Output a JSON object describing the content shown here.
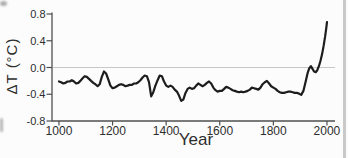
{
  "figure": {
    "background": "#fcfcfc",
    "line_color": "#1d1d1d",
    "axis_color": "#4f4f4f",
    "zero_line_color": "#c8c8c8",
    "text_color": "#2e2e2e",
    "artifact_color": "#c9c9c9"
  },
  "chart_data": {
    "type": "line",
    "title": "",
    "xlabel": "Year",
    "ylabel": "ΔT (°C)",
    "xlim": [
      974,
      2030
    ],
    "ylim": [
      -0.8,
      0.8
    ],
    "grid": "horizontal zero line only",
    "legend": "none",
    "x_ticks": {
      "values": [
        1000,
        1200,
        1400,
        1600,
        1800,
        2000
      ],
      "labels": [
        "1000",
        "1200",
        "1400",
        "1600",
        "1800",
        "2000"
      ]
    },
    "y_ticks": {
      "values": [
        0.8,
        0.4,
        0.0,
        -0.4,
        -0.8
      ],
      "labels": [
        "0.8",
        "0.4",
        "0.0",
        "-0.4",
        "-0.8"
      ]
    },
    "series": [
      {
        "name": "Temperature anomaly reconstruction",
        "x": [
          1000,
          1008,
          1016,
          1024,
          1032,
          1040,
          1048,
          1056,
          1064,
          1072,
          1080,
          1088,
          1096,
          1104,
          1112,
          1120,
          1128,
          1136,
          1144,
          1152,
          1160,
          1168,
          1176,
          1184,
          1192,
          1200,
          1208,
          1216,
          1224,
          1232,
          1240,
          1248,
          1256,
          1264,
          1272,
          1280,
          1288,
          1296,
          1304,
          1312,
          1320,
          1328,
          1336,
          1344,
          1352,
          1360,
          1368,
          1376,
          1384,
          1392,
          1400,
          1408,
          1416,
          1424,
          1432,
          1440,
          1448,
          1456,
          1464,
          1472,
          1480,
          1488,
          1496,
          1504,
          1512,
          1520,
          1528,
          1536,
          1544,
          1552,
          1560,
          1568,
          1576,
          1584,
          1592,
          1600,
          1608,
          1616,
          1624,
          1632,
          1640,
          1648,
          1656,
          1664,
          1672,
          1680,
          1688,
          1696,
          1704,
          1712,
          1720,
          1728,
          1736,
          1744,
          1752,
          1760,
          1768,
          1776,
          1784,
          1792,
          1800,
          1808,
          1816,
          1824,
          1832,
          1840,
          1848,
          1856,
          1864,
          1872,
          1880,
          1888,
          1896,
          1904,
          1912,
          1920,
          1928,
          1934,
          1940,
          1946,
          1952,
          1958,
          1964,
          1970,
          1976,
          1982,
          1988,
          1993,
          1997,
          2000
        ],
        "y": [
          -0.21,
          -0.22,
          -0.24,
          -0.23,
          -0.21,
          -0.21,
          -0.19,
          -0.21,
          -0.24,
          -0.23,
          -0.2,
          -0.16,
          -0.13,
          -0.14,
          -0.17,
          -0.2,
          -0.23,
          -0.25,
          -0.28,
          -0.25,
          -0.14,
          -0.06,
          -0.09,
          -0.18,
          -0.27,
          -0.31,
          -0.3,
          -0.28,
          -0.26,
          -0.25,
          -0.26,
          -0.28,
          -0.27,
          -0.26,
          -0.26,
          -0.24,
          -0.24,
          -0.22,
          -0.19,
          -0.15,
          -0.12,
          -0.13,
          -0.22,
          -0.43,
          -0.37,
          -0.27,
          -0.19,
          -0.12,
          -0.13,
          -0.21,
          -0.27,
          -0.29,
          -0.27,
          -0.29,
          -0.33,
          -0.36,
          -0.42,
          -0.5,
          -0.48,
          -0.38,
          -0.32,
          -0.3,
          -0.32,
          -0.31,
          -0.27,
          -0.24,
          -0.26,
          -0.28,
          -0.26,
          -0.23,
          -0.21,
          -0.24,
          -0.3,
          -0.34,
          -0.36,
          -0.35,
          -0.35,
          -0.32,
          -0.29,
          -0.3,
          -0.32,
          -0.34,
          -0.35,
          -0.36,
          -0.37,
          -0.36,
          -0.37,
          -0.36,
          -0.35,
          -0.33,
          -0.3,
          -0.31,
          -0.32,
          -0.33,
          -0.3,
          -0.25,
          -0.22,
          -0.2,
          -0.24,
          -0.28,
          -0.3,
          -0.32,
          -0.35,
          -0.37,
          -0.38,
          -0.38,
          -0.37,
          -0.36,
          -0.36,
          -0.37,
          -0.38,
          -0.38,
          -0.39,
          -0.41,
          -0.35,
          -0.22,
          -0.08,
          -0.01,
          0.02,
          -0.02,
          -0.06,
          -0.07,
          -0.04,
          0.02,
          0.1,
          0.2,
          0.33,
          0.46,
          0.58,
          0.68
        ]
      }
    ]
  }
}
